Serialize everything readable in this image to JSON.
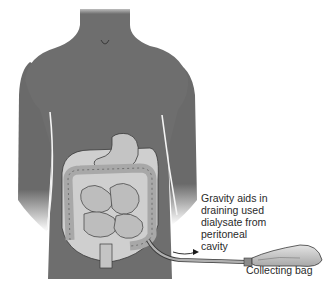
{
  "figure": {
    "labels": {
      "drainage_note": "Gravity aids in\ndraining used\ndialysate from\nperitoneal\ncavity",
      "bag": "Collecting bag"
    },
    "colors": {
      "body": "#6e6e6e",
      "body_shade": "#5a5a5a",
      "cavity": "#cfcfcf",
      "organ": "#bdbdbd",
      "outline": "#3a3a3a",
      "tube": "#9a9a9a",
      "bag": "#c8c8c8",
      "text": "#2a2a2a"
    }
  }
}
